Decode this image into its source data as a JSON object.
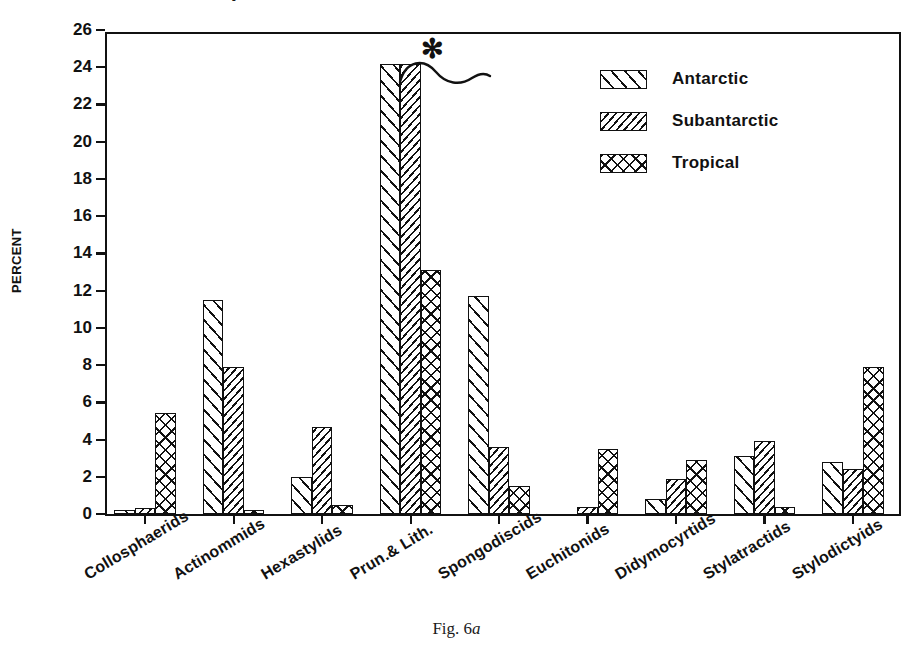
{
  "figure": {
    "caption_prefix": "Fig. 6",
    "caption_suffix": "a",
    "clipped_title_fragment": "G"
  },
  "axis": {
    "y_title": "PERCENT",
    "y_ticks": [
      "0",
      "2",
      "4",
      "6",
      "8",
      "10",
      "12",
      "14",
      "16",
      "18",
      "20",
      "22",
      "24",
      "26"
    ]
  },
  "legend": {
    "entries": [
      {
        "label": "Antarctic",
        "pattern": "diagonal-hatch-sparse"
      },
      {
        "label": "Subantarctic",
        "pattern": "diagonal-hatch-dense"
      },
      {
        "label": "Tropical",
        "pattern": "cross-hatch"
      }
    ]
  },
  "annotation": {
    "asterisk": "✻",
    "meaning": "axis-break-truncated-bars"
  },
  "chart_data": {
    "type": "bar",
    "title": "",
    "xlabel": "",
    "ylabel": "PERCENT",
    "ylim": [
      0,
      26
    ],
    "ytick_step": 2,
    "grid": false,
    "legend_position": "top-right",
    "categories": [
      "Collosphaerids",
      "Actinommids",
      "Hexastylids",
      "Prun.& Lith.",
      "Spongodiscids",
      "Euchitonids",
      "Didymocyrtids",
      "Stylatractids",
      "Stylodictyids"
    ],
    "series": [
      {
        "name": "Antarctic",
        "values": [
          0.2,
          11.5,
          2.0,
          24.2,
          11.7,
          0.0,
          0.8,
          3.1,
          2.8
        ]
      },
      {
        "name": "Subantarctic",
        "values": [
          0.3,
          7.9,
          4.7,
          24.2,
          3.6,
          0.4,
          1.9,
          3.9,
          2.4
        ]
      },
      {
        "name": "Tropical",
        "values": [
          5.4,
          0.2,
          0.5,
          13.1,
          1.5,
          3.5,
          2.9,
          0.4,
          7.9
        ]
      }
    ],
    "annotations": [
      {
        "text": "✻",
        "category": "Prun.& Lith.",
        "note": "bars truncated / axis break"
      }
    ]
  },
  "colors": {
    "ink": "#111111",
    "background": "#ffffff"
  }
}
